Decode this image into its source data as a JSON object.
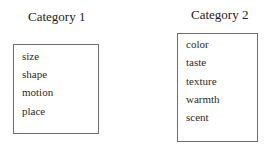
{
  "categories": [
    {
      "title": "Category 1",
      "items": [
        "size",
        "shape",
        "motion",
        "place"
      ]
    },
    {
      "title": "Category 2",
      "items": [
        "color",
        "taste",
        "texture",
        "warmth",
        "scent"
      ]
    }
  ],
  "colors": {
    "border": "#6e6e6e",
    "text": "#2a2a2a",
    "background": "#ffffff"
  }
}
